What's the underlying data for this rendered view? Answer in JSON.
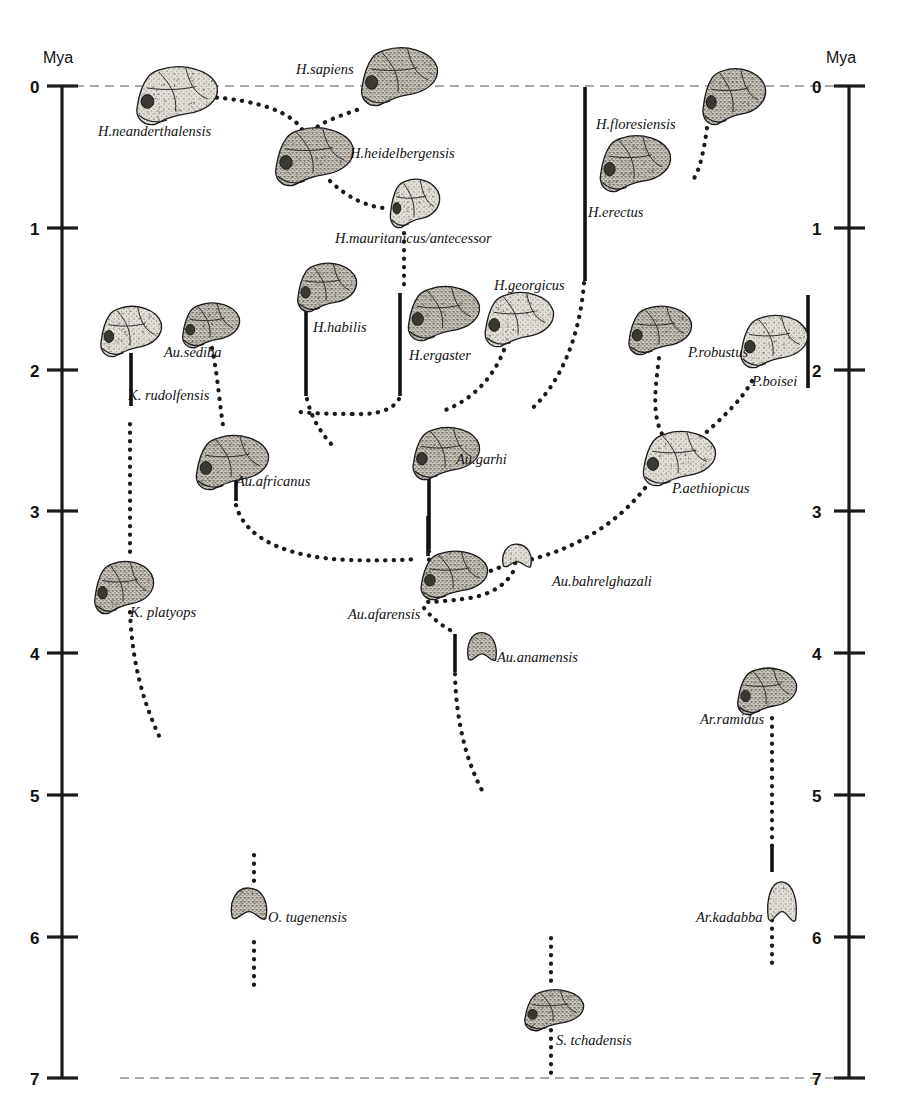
{
  "figure": {
    "kind": "hominin-phylogeny-timeline",
    "background": "#ffffff",
    "ink_color": "#111111",
    "epoch_line_color": "#8d8d8d"
  },
  "axes": {
    "left": {
      "title": "Mya",
      "ticks": [
        "0",
        "1",
        "2",
        "3",
        "4",
        "5",
        "6",
        "7"
      ]
    },
    "right": {
      "title": "Mya",
      "ticks": [
        "0",
        "1",
        "2",
        "3",
        "4",
        "5",
        "6",
        "7"
      ]
    }
  },
  "chart_data": {
    "type": "scatter",
    "title": "",
    "xlabel": "",
    "ylabel": "Mya",
    "ylim": [
      0,
      7
    ],
    "grid": false,
    "legend": "none",
    "units": "million years ago",
    "axis_direction": "inverted (0 Mya at top, 7 Mya at bottom)",
    "horizontal_marker_lines_mya": [
      0,
      7
    ],
    "taxa": [
      {
        "name": "H.neanderthalensis",
        "label_x": 98,
        "label_y": 124,
        "skull_x": 133,
        "skull_y": 63,
        "skull_w": 85,
        "skull_h": 62,
        "range_mya": null
      },
      {
        "name": "H.sapiens",
        "label_x": 296,
        "label_y": 62,
        "skull_x": 358,
        "skull_y": 44,
        "skull_w": 80,
        "skull_h": 62,
        "range_mya": null
      },
      {
        "name": "H.heidelbergensis",
        "label_x": 350,
        "label_y": 146,
        "skull_x": 272,
        "skull_y": 124,
        "skull_w": 82,
        "skull_h": 62,
        "range_mya": null
      },
      {
        "name": "H.mauritanicus/antecessor",
        "label_x": 335,
        "label_y": 231,
        "skull_x": 388,
        "skull_y": 176,
        "skull_w": 52,
        "skull_h": 52,
        "range_mya": null
      },
      {
        "name": "H.floresiensis",
        "label_x": 596,
        "label_y": 117,
        "skull_x": 700,
        "skull_y": 65,
        "skull_w": 66,
        "skull_h": 60,
        "range_mya": null
      },
      {
        "name": "H.erectus",
        "label_x": 588,
        "label_y": 205,
        "skull_x": 597,
        "skull_y": 132,
        "skull_w": 74,
        "skull_h": 60,
        "range_mya": [
          0.05,
          1.37
        ]
      },
      {
        "name": "H.georgicus",
        "label_x": 494,
        "label_y": 278,
        "skull_x": 482,
        "skull_y": 289,
        "skull_w": 72,
        "skull_h": 58,
        "range_mya": null
      },
      {
        "name": "H.habilis",
        "label_x": 313,
        "label_y": 320,
        "skull_x": 295,
        "skull_y": 260,
        "skull_w": 62,
        "skull_h": 52,
        "range_mya": [
          1.48,
          2.18
        ]
      },
      {
        "name": "H.ergaster",
        "label_x": 409,
        "label_y": 348,
        "skull_x": 405,
        "skull_y": 283,
        "skull_w": 75,
        "skull_h": 58,
        "range_mya": [
          1.46,
          2.18
        ]
      },
      {
        "name": "K. rudolfensis",
        "label_x": 128,
        "label_y": 388,
        "skull_x": 98,
        "skull_y": 303,
        "skull_w": 64,
        "skull_h": 54,
        "range_mya": [
          1.7,
          2.25
        ]
      },
      {
        "name": "Au.sediba",
        "label_x": 164,
        "label_y": 345,
        "skull_x": 180,
        "skull_y": 300,
        "skull_w": 60,
        "skull_h": 48,
        "range_mya": null
      },
      {
        "name": "P.robustus",
        "label_x": 688,
        "label_y": 345,
        "skull_x": 626,
        "skull_y": 303,
        "skull_w": 66,
        "skull_h": 52,
        "range_mya": null
      },
      {
        "name": "P.boisei",
        "label_x": 752,
        "label_y": 374,
        "skull_x": 738,
        "skull_y": 312,
        "skull_w": 70,
        "skull_h": 56,
        "range_mya": [
          1.35,
          2.15
        ]
      },
      {
        "name": "Au.africanus",
        "label_x": 236,
        "label_y": 474,
        "skull_x": 193,
        "skull_y": 432,
        "skull_w": 76,
        "skull_h": 58,
        "range_mya": [
          2.66,
          3.15
        ]
      },
      {
        "name": "Au.garhi",
        "label_x": 456,
        "label_y": 452,
        "skull_x": 410,
        "skull_y": 424,
        "skull_w": 70,
        "skull_h": 56,
        "range_mya": [
          2.7,
          3.38
        ]
      },
      {
        "name": "P.aethiopicus",
        "label_x": 672,
        "label_y": 481,
        "skull_x": 640,
        "skull_y": 428,
        "skull_w": 76,
        "skull_h": 58,
        "range_mya": null
      },
      {
        "name": "K. platyops",
        "label_x": 130,
        "label_y": 605,
        "skull_x": 92,
        "skull_y": 558,
        "skull_w": 62,
        "skull_h": 56,
        "range_mya": null
      },
      {
        "name": "Au.afarensis",
        "label_x": 348,
        "label_y": 607,
        "skull_x": 418,
        "skull_y": 548,
        "skull_w": 70,
        "skull_h": 52,
        "range_mya": [
          3.36,
          3.86
        ]
      },
      {
        "name": "Au.bahrelghazali",
        "label_x": 552,
        "label_y": 574,
        "skull_x": 500,
        "skull_y": 542,
        "skull_w": 34,
        "skull_h": 28,
        "range_mya": null
      },
      {
        "name": "Au.anamensis",
        "label_x": 497,
        "label_y": 650,
        "skull_x": 465,
        "skull_y": 630,
        "skull_w": 34,
        "skull_h": 34,
        "range_mya": [
          3.92,
          4.3
        ]
      },
      {
        "name": "Ar.ramidus",
        "label_x": 700,
        "label_y": 712,
        "skull_x": 735,
        "skull_y": 665,
        "skull_w": 62,
        "skull_h": 50,
        "range_mya": [
          4.38,
          5.7
        ]
      },
      {
        "name": "Ar.kadabba",
        "label_x": 696,
        "label_y": 910,
        "skull_x": 765,
        "skull_y": 878,
        "skull_w": 34,
        "skull_h": 48,
        "range_mya": null
      },
      {
        "name": "O. tugenensis",
        "label_x": 268,
        "label_y": 910,
        "skull_x": 228,
        "skull_y": 885,
        "skull_w": 42,
        "skull_h": 38,
        "range_mya": null
      },
      {
        "name": "S. tchadensis",
        "label_x": 556,
        "label_y": 1033,
        "skull_x": 522,
        "skull_y": 987,
        "skull_w": 62,
        "skull_h": 44,
        "range_mya": null
      }
    ]
  }
}
